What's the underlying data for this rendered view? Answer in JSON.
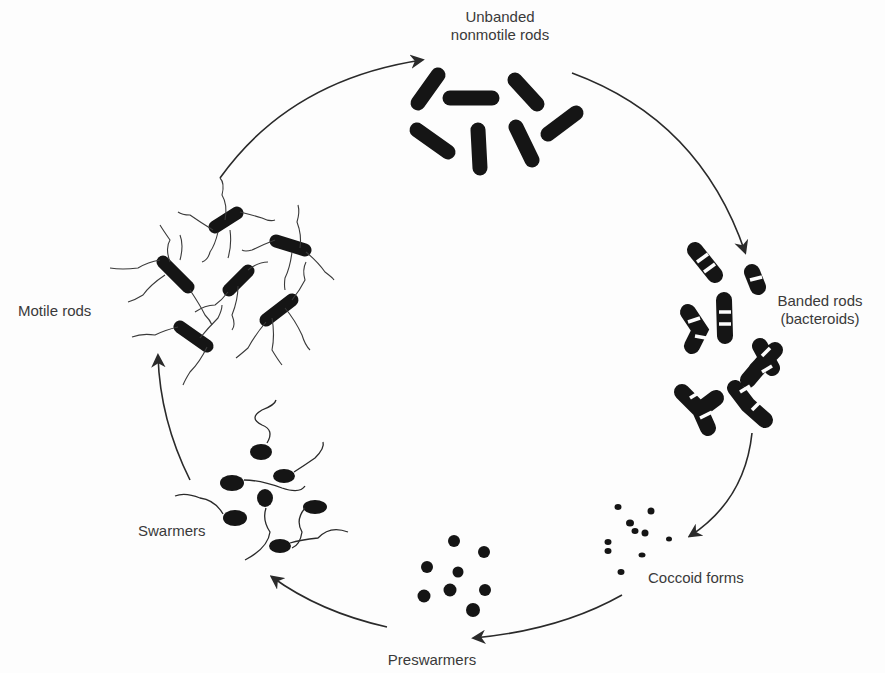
{
  "diagram": {
    "type": "life-cycle",
    "stages": [
      {
        "id": "unbanded",
        "label_line1": "Unbanded",
        "label_line2": "nonmotile rods"
      },
      {
        "id": "banded",
        "label_line1": "Banded rods",
        "label_line2": "(bacteroids)"
      },
      {
        "id": "coccoid",
        "label_line1": "Coccoid forms"
      },
      {
        "id": "preswarmers",
        "label_line1": "Preswarmers"
      },
      {
        "id": "swarmers",
        "label_line1": "Swarmers"
      },
      {
        "id": "motile",
        "label_line1": "Motile rods"
      }
    ],
    "edges": [
      {
        "from": "unbanded",
        "to": "banded"
      },
      {
        "from": "banded",
        "to": "coccoid"
      },
      {
        "from": "coccoid",
        "to": "preswarmers"
      },
      {
        "from": "preswarmers",
        "to": "swarmers"
      },
      {
        "from": "swarmers",
        "to": "motile"
      },
      {
        "from": "motile",
        "to": "unbanded"
      }
    ],
    "colors": {
      "ink": "#1a1a1a",
      "text": "#3a3a3a",
      "background": "#fdfdfd"
    }
  }
}
